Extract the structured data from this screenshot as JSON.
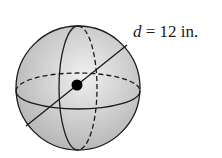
{
  "figure": {
    "type": "sphere-diagram",
    "label": {
      "variable": "d",
      "equals": " = ",
      "value": "12 in."
    },
    "colors": {
      "sphere_fill_light": "#ededed",
      "sphere_fill_dark": "#b5b5b5",
      "stroke": "#1a1a1a"
    }
  }
}
